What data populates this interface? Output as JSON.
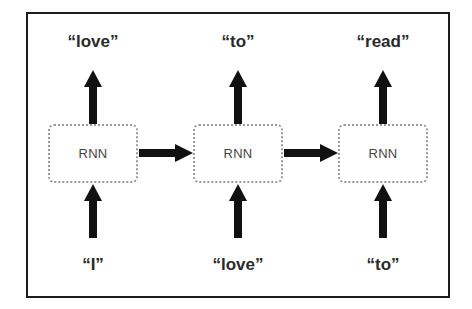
{
  "diagram": {
    "cells": [
      {
        "label": "RNN",
        "input": "“I”",
        "output": "“love”"
      },
      {
        "label": "RNN",
        "input": "“love”",
        "output": "“to”"
      },
      {
        "label": "RNN",
        "input": "“to”",
        "output": "“read”"
      }
    ],
    "colors": {
      "frame": "#1c1c1c",
      "cell_border": "#9a9a9a",
      "arrow": "#111111",
      "text": "#2a2a2a"
    }
  }
}
